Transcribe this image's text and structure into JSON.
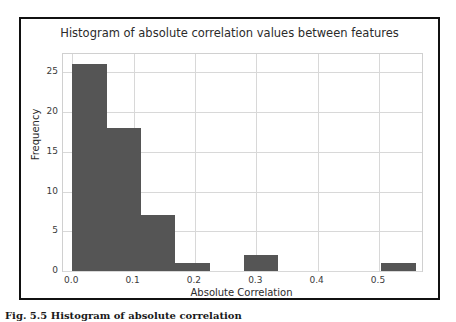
{
  "figure": {
    "caption": "Fig. 5.5  Histogram of absolute correlation"
  },
  "chart_data": {
    "type": "bar",
    "title": "Histogram of absolute correlation values between features",
    "xlabel": "Absolute Correlation",
    "ylabel": "Frequency",
    "xlim": [
      -0.015,
      0.57
    ],
    "ylim": [
      0,
      27.3
    ],
    "grid": true,
    "legend": false,
    "bar_color": "#555555",
    "background_color": "#ffffff",
    "grid_color": "#d8d8d8",
    "xticks": [
      "0.0",
      "0.1",
      "0.2",
      "0.3",
      "0.4",
      "0.5"
    ],
    "xtick_values": [
      0.0,
      0.1,
      0.2,
      0.3,
      0.4,
      0.5
    ],
    "yticks": [
      "0",
      "5",
      "10",
      "15",
      "20",
      "25"
    ],
    "ytick_values": [
      0,
      5,
      10,
      15,
      20,
      25
    ],
    "bins": [
      {
        "left": 0.0,
        "right": 0.056,
        "value": 26
      },
      {
        "left": 0.056,
        "right": 0.112,
        "value": 18
      },
      {
        "left": 0.112,
        "right": 0.168,
        "value": 7
      },
      {
        "left": 0.168,
        "right": 0.224,
        "value": 1
      },
      {
        "left": 0.224,
        "right": 0.28,
        "value": 0
      },
      {
        "left": 0.28,
        "right": 0.336,
        "value": 2
      },
      {
        "left": 0.336,
        "right": 0.392,
        "value": 0
      },
      {
        "left": 0.392,
        "right": 0.448,
        "value": 0
      },
      {
        "left": 0.448,
        "right": 0.504,
        "value": 0
      },
      {
        "left": 0.504,
        "right": 0.56,
        "value": 1
      }
    ]
  }
}
